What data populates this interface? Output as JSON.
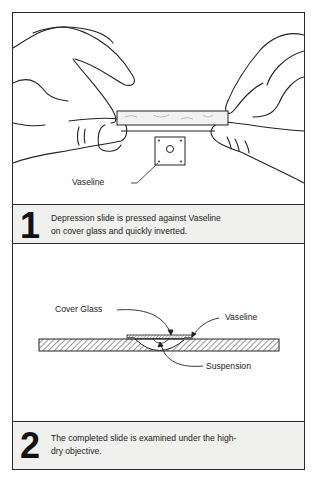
{
  "steps": [
    {
      "number": "1",
      "caption_line1": "Depression slide is pressed against Vaseline",
      "caption_line2": "on cover glass and quickly inverted.",
      "illustration": {
        "description": "Two hands holding a depression slide above a square cover glass with Vaseline at its corners",
        "labels": {
          "vaseline": "Vaseline"
        }
      }
    },
    {
      "number": "2",
      "caption_line1": "The completed slide is examined under the high-",
      "caption_line2": "dry objective.",
      "illustration": {
        "description": "Cross-section of inverted cover glass over depression slide with suspension drop",
        "labels": {
          "cover_glass": "Cover Glass",
          "vaseline": "Vaseline",
          "suspension": "Suspension"
        }
      }
    }
  ]
}
